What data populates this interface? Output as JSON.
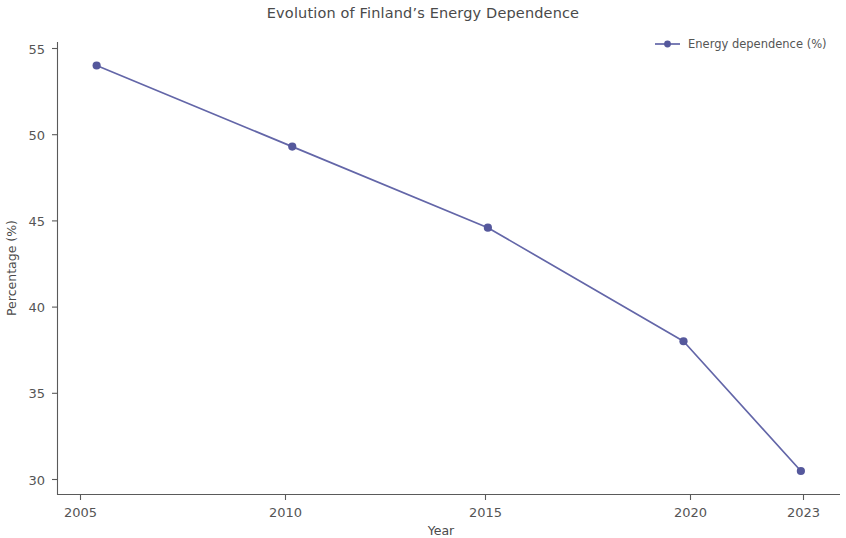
{
  "chart_data": {
    "type": "line",
    "title": "Evolution of Finland’s Energy Dependence",
    "xlabel": "Year",
    "ylabel": "Percentage (%)",
    "x": [
      2005,
      2010,
      2015,
      2020,
      2023
    ],
    "categories": [
      "2005",
      "2010",
      "2015",
      "2020",
      "2023"
    ],
    "xticklabels": [
      "2005",
      "2010",
      "2015",
      "2020",
      "2023"
    ],
    "yticklabels": [
      "30",
      "35",
      "40",
      "45",
      "50",
      "55"
    ],
    "yticks": [
      30,
      35,
      40,
      45,
      50,
      55
    ],
    "values": [
      55,
      50,
      45,
      38,
      30
    ],
    "series": [
      {
        "name": "Energy dependence (%)",
        "values": [
          55,
          50,
          45,
          38,
          30
        ]
      }
    ],
    "xlim": [
      2004.0,
      2024.0
    ],
    "ylim": [
      28.55,
      56.45
    ],
    "grid": false,
    "legend": {
      "position": "top-right",
      "entries": [
        "Energy dependence (%)"
      ]
    },
    "colors": {
      "series_line": "#6366a8",
      "marker": "#55589c",
      "text": "#4a4a4a",
      "tick_text": "#555555",
      "spine": "#5a5a5a",
      "background": "#ffffff"
    },
    "marker_style": "circle",
    "annotations": []
  },
  "legend": {
    "entry_label": "Energy dependence (%)"
  },
  "axes": {
    "x_title": "Year",
    "y_title": "Percentage (%)"
  }
}
